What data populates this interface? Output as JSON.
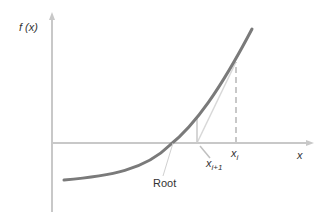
{
  "diagram": {
    "y_axis_label": "f (x)",
    "x_axis_label": "x",
    "labels": {
      "root": "Root",
      "x_i": "x",
      "x_i_sub": "i",
      "x_i1": "x",
      "x_i1_sub": "i+1"
    },
    "colors": {
      "axis": "#c8c8c8",
      "curve": "#7a7a7a",
      "tangent": "#d0d0d0",
      "dashed": "#c8c8c8",
      "text": "#333333"
    }
  }
}
